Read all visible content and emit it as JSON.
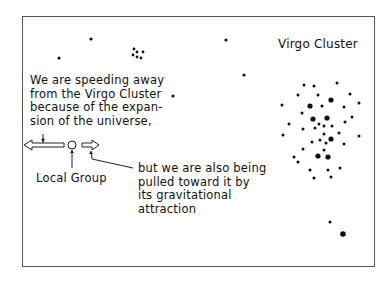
{
  "labels": {
    "virgo_cluster": "Virgo Cluster",
    "speeding_away": "We are speeding away\nfrom the Virgo Cluster\nbecause of the expan-\nsion of the universe,",
    "local_group": "Local Group",
    "pulled_toward": "but we are also being\npulled toward it by\nits gravitational\nattraction"
  },
  "colors": {
    "ink": "#111111",
    "frame": "#555555",
    "background": "#ffffff"
  },
  "icons": {
    "expansion_arrow": "left-hollow-arrow",
    "local_group_marker": "hollow-circle",
    "gravity_arrow": "right-hollow-arrow"
  }
}
